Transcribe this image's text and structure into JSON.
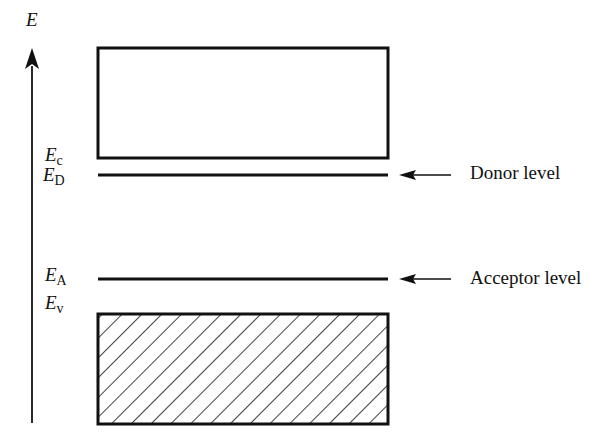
{
  "diagram": {
    "type": "energy-band-diagram",
    "axis": {
      "label": "E",
      "direction": "up"
    },
    "levels": [
      {
        "id": "Ec",
        "symbol": "E",
        "subscript": "c",
        "name": "Conduction band edge"
      },
      {
        "id": "ED",
        "symbol": "E",
        "subscript": "D",
        "name": "Donor level",
        "annotation": "Donor level"
      },
      {
        "id": "EA",
        "symbol": "E",
        "subscript": "A",
        "name": "Acceptor level",
        "annotation": "Acceptor level"
      },
      {
        "id": "Ev",
        "symbol": "E",
        "subscript": "v",
        "name": "Valence band edge"
      }
    ],
    "bands": [
      {
        "id": "conduction-band",
        "fill": "empty"
      },
      {
        "id": "valence-band",
        "fill": "hatched"
      }
    ],
    "colors": {
      "stroke": "#111111",
      "background": "#ffffff"
    }
  },
  "labels": {
    "axis": "E",
    "ec_sym": "E",
    "ec_sub": "c",
    "ed_sym": "E",
    "ed_sub": "D",
    "ea_sym": "E",
    "ea_sub": "A",
    "ev_sym": "E",
    "ev_sub": "v",
    "donor": "Donor level",
    "acceptor": "Acceptor level"
  }
}
